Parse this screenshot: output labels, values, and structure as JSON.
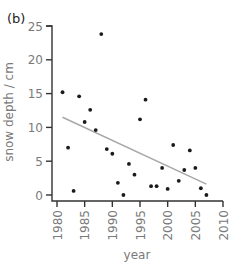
{
  "chart_data": {
    "type": "scatter",
    "panel_label": "(b)",
    "title": "",
    "xlabel": "year",
    "ylabel": "snow depth / cm",
    "xlim": [
      1980,
      2010
    ],
    "ylim": [
      0,
      25
    ],
    "xticks": [
      1980,
      1985,
      1990,
      1995,
      2000,
      2005,
      2010
    ],
    "yticks": [
      0,
      5,
      10,
      15,
      20,
      25
    ],
    "grid": false,
    "legend": null,
    "series": [
      {
        "name": "snow depth",
        "points": [
          {
            "x": 1981,
            "y": 15.2
          },
          {
            "x": 1982,
            "y": 7.0
          },
          {
            "x": 1983,
            "y": 0.6
          },
          {
            "x": 1984,
            "y": 14.6
          },
          {
            "x": 1985,
            "y": 10.8
          },
          {
            "x": 1986,
            "y": 12.6
          },
          {
            "x": 1987,
            "y": 9.6
          },
          {
            "x": 1988,
            "y": 23.8
          },
          {
            "x": 1989,
            "y": 6.8
          },
          {
            "x": 1990,
            "y": 6.1
          },
          {
            "x": 1991,
            "y": 1.8
          },
          {
            "x": 1992,
            "y": 0.0
          },
          {
            "x": 1993,
            "y": 4.6
          },
          {
            "x": 1994,
            "y": 3.0
          },
          {
            "x": 1995,
            "y": 11.2
          },
          {
            "x": 1996,
            "y": 14.1
          },
          {
            "x": 1997,
            "y": 1.3
          },
          {
            "x": 1998,
            "y": 1.3
          },
          {
            "x": 1999,
            "y": 4.0
          },
          {
            "x": 2000,
            "y": 0.9
          },
          {
            "x": 2001,
            "y": 7.4
          },
          {
            "x": 2002,
            "y": 2.1
          },
          {
            "x": 2003,
            "y": 3.7
          },
          {
            "x": 2004,
            "y": 6.6
          },
          {
            "x": 2005,
            "y": 4.0
          },
          {
            "x": 2006,
            "y": 1.0
          },
          {
            "x": 2007,
            "y": 0.0
          }
        ]
      }
    ],
    "trend_line": {
      "name": "linear trend",
      "start": {
        "x": 1981,
        "y": 11.5
      },
      "end": {
        "x": 2007,
        "y": 1.6
      }
    }
  }
}
